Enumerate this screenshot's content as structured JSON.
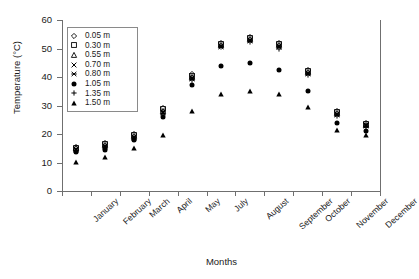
{
  "chart_data": {
    "type": "scatter",
    "title": "",
    "xlabel": "Months",
    "ylabel": "Temperature (°C)",
    "ylim": [
      0,
      60
    ],
    "ytick_values": [
      0,
      10,
      20,
      30,
      40,
      50,
      60
    ],
    "ytick_labels": [
      "0",
      "10",
      "20",
      "30",
      "40",
      "50",
      "60"
    ],
    "grid": false,
    "legend_position": "top-left-inside",
    "categories": [
      "January",
      "February",
      "March",
      "April",
      "May",
      "July",
      "August",
      "September",
      "October",
      "November",
      "December"
    ],
    "series": [
      {
        "name": "0.05 m",
        "marker": "open-diamond",
        "values": [
          15.5,
          16.8,
          20.0,
          29.0,
          41.0,
          52.0,
          54.0,
          52.0,
          42.5,
          28.0,
          24.0
        ]
      },
      {
        "name": "0.30 m",
        "marker": "open-square",
        "values": [
          15.2,
          16.4,
          19.6,
          28.6,
          40.5,
          51.6,
          53.6,
          51.6,
          42.0,
          27.6,
          23.6
        ]
      },
      {
        "name": "0.55 m",
        "marker": "open-triangle",
        "values": [
          15.0,
          16.1,
          19.3,
          28.2,
          40.1,
          51.3,
          53.3,
          51.2,
          41.7,
          27.3,
          23.3
        ]
      },
      {
        "name": "0.70 m",
        "marker": "cross",
        "values": [
          14.7,
          15.8,
          19.0,
          27.8,
          39.6,
          51.0,
          53.0,
          50.8,
          41.4,
          27.0,
          23.1
        ]
      },
      {
        "name": "0.80 m",
        "marker": "star",
        "values": [
          14.4,
          15.5,
          18.7,
          27.4,
          39.2,
          50.7,
          52.7,
          50.4,
          41.0,
          26.7,
          22.8
        ]
      },
      {
        "name": "1.05 m",
        "marker": "filled-circle",
        "values": [
          13.6,
          14.5,
          17.8,
          25.9,
          37.2,
          44.0,
          45.0,
          42.3,
          35.0,
          24.0,
          21.0
        ]
      },
      {
        "name": "1.35 m",
        "marker": "plus",
        "values": [
          14.1,
          15.1,
          18.4,
          27.0,
          38.8,
          50.4,
          52.4,
          50.0,
          40.6,
          26.4,
          22.5
        ]
      },
      {
        "name": "1.50 m",
        "marker": "filled-triangle",
        "values": [
          10.2,
          12.0,
          15.0,
          19.5,
          28.0,
          34.0,
          35.0,
          34.0,
          29.5,
          21.5,
          19.5
        ]
      }
    ],
    "legend_entries": [
      {
        "label": "0.05 m",
        "marker": "open-diamond"
      },
      {
        "label": "0.30 m",
        "marker": "open-square"
      },
      {
        "label": "0.55 m",
        "marker": "open-triangle"
      },
      {
        "label": "0.70 m",
        "marker": "cross"
      },
      {
        "label": "0.80 m",
        "marker": "star"
      },
      {
        "label": "1.05 m",
        "marker": "filled-circle"
      },
      {
        "label": "1.35 m",
        "marker": "plus"
      },
      {
        "label": "1.50 m",
        "marker": "filled-triangle"
      }
    ],
    "colors": {
      "marker": "#000000",
      "axis": "#6f6f6f",
      "text": "#1a1a1a",
      "background": "#ffffff"
    }
  }
}
